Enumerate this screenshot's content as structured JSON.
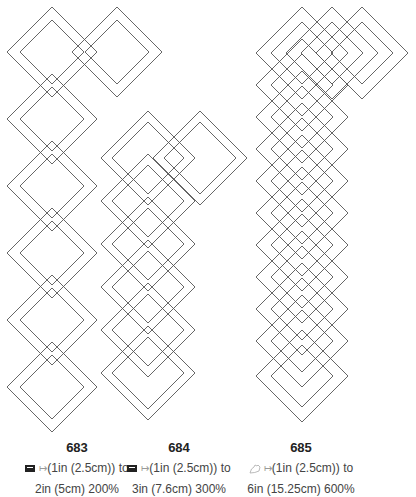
{
  "patterns": [
    {
      "id": "683",
      "icon": "sewing-machine-icon",
      "line1_prefix": "(1in (2.5cm)) to",
      "line2": "2in (5cm) 200%",
      "outer_half": 45,
      "inner_half": 32,
      "diamonds": [
        [
          52,
          52
        ],
        [
          117,
          52
        ],
        [
          52,
          119
        ],
        [
          52,
          186
        ],
        [
          52,
          253
        ],
        [
          52,
          320
        ],
        [
          52,
          387
        ]
      ]
    },
    {
      "id": "684",
      "icon": "sewing-machine-icon",
      "line1_prefix": "(1in (2.5cm)) to",
      "line2": "3in (7.6cm) 300%",
      "outer_half": 47,
      "inner_half": 36,
      "diamonds": [
        [
          148,
          158
        ],
        [
          200,
          158
        ],
        [
          148,
          201
        ],
        [
          148,
          244
        ],
        [
          148,
          287
        ],
        [
          148,
          330
        ],
        [
          148,
          373
        ]
      ]
    },
    {
      "id": "685",
      "icon": "free-motion-hand-icon",
      "line1_prefix": "(1in (2.5cm)) to",
      "line2": "6in (15.25cm) 600%",
      "outer_half": 46,
      "inner_half": 31,
      "diamonds": [
        [
          302,
          53
        ],
        [
          332,
          53
        ],
        [
          362,
          53
        ],
        [
          302,
          85
        ],
        [
          302,
          117
        ],
        [
          302,
          149
        ],
        [
          302,
          181
        ],
        [
          302,
          213
        ],
        [
          302,
          245
        ],
        [
          302,
          277
        ],
        [
          302,
          309
        ],
        [
          302,
          341
        ],
        [
          302,
          376
        ]
      ]
    }
  ],
  "style": {
    "stroke": "#555555"
  }
}
